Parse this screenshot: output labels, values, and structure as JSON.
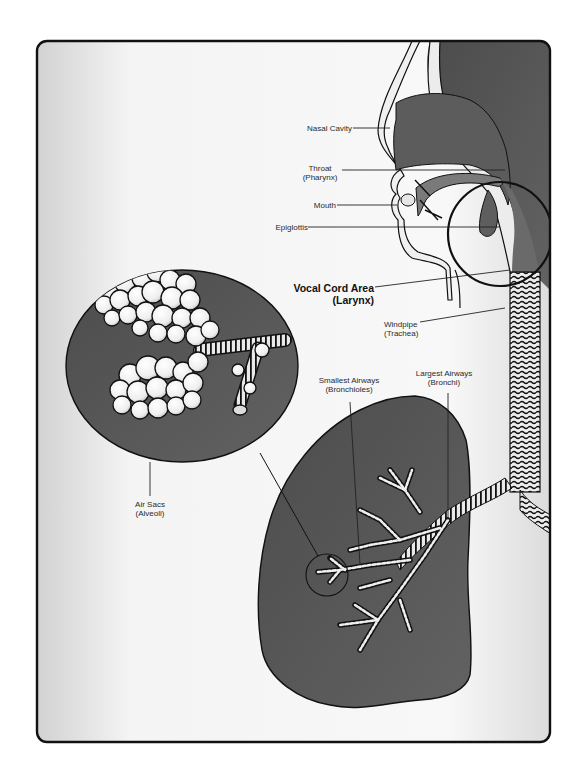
{
  "diagram": {
    "colors": {
      "background": "#ffffff",
      "panel_light": "#f4f4f4",
      "panel_shade": "#d6d6d6",
      "tissue_dark": "#5a5a5a",
      "tissue_light": "#e8e8e8",
      "outline": "#111111"
    },
    "labels": {
      "nasal_cavity": {
        "line1": "Nasal Cavity"
      },
      "throat": {
        "line1": "Throat",
        "line2": "(Pharynx)"
      },
      "mouth": {
        "line1": "Mouth"
      },
      "epiglottis": {
        "line1": "Epiglottis"
      },
      "larynx": {
        "line1": "Vocal Cord Area",
        "line2": "(Larynx)"
      },
      "trachea": {
        "line1": "Windpipe",
        "line2": "(Trachea)"
      },
      "bronchioles": {
        "line1": "Smallest Airways",
        "line2": "(Bronchioles)"
      },
      "bronchi": {
        "line1": "Largest Airways",
        "line2": "(Bronchi)"
      },
      "alveoli": {
        "line1": "Air Sacs",
        "line2": "(Alveoli)"
      }
    },
    "structures": [
      "head-profile",
      "nasal-cavity",
      "mouth",
      "tongue",
      "pharynx",
      "epiglottis",
      "larynx-highlight-circle",
      "trachea",
      "bronchi",
      "lung",
      "bronchiole-tree",
      "alveoli-magnifier",
      "magnified-region-circle"
    ]
  }
}
